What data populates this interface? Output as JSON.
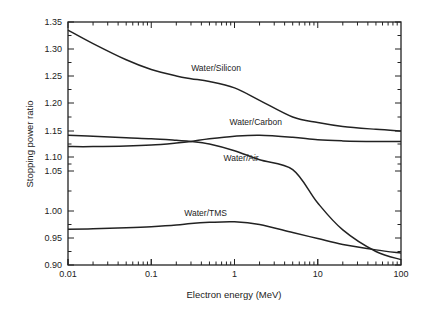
{
  "chart_data": {
    "type": "line",
    "title": "",
    "xlabel": "Electron energy (MeV)",
    "ylabel": "Stopping power ratio",
    "xscale": "log",
    "xlim": [
      0.01,
      100
    ],
    "ylim": [
      0.9,
      1.35
    ],
    "grid": false,
    "legend": "inline labels",
    "x_ticks": [
      "0.01",
      "0.1",
      "1",
      "10",
      "100"
    ],
    "y_ticks": [
      "0.90",
      "0.95",
      "1.00",
      "1.05",
      "1.10",
      "1.15",
      "1.20",
      "1.25",
      "1.30",
      "1.35"
    ],
    "x": [
      0.01,
      0.02,
      0.05,
      0.1,
      0.2,
      0.3,
      0.5,
      1,
      2,
      5,
      10,
      20,
      50,
      100
    ],
    "series": [
      {
        "name": "Water/Silicon",
        "values": [
          1.335,
          1.31,
          1.28,
          1.262,
          1.25,
          1.245,
          1.24,
          1.228,
          1.205,
          1.175,
          1.165,
          1.158,
          1.153,
          1.15
        ]
      },
      {
        "name": "Water/Carbon",
        "values": [
          1.12,
          1.12,
          1.121,
          1.123,
          1.127,
          1.13,
          1.135,
          1.14,
          1.142,
          1.138,
          1.133,
          1.131,
          1.13,
          1.13
        ]
      },
      {
        "name": "Water/Air",
        "values": [
          1.142,
          1.14,
          1.137,
          1.135,
          1.132,
          1.13,
          1.125,
          1.112,
          1.09,
          1.055,
          1.01,
          0.965,
          0.925,
          0.91
        ]
      },
      {
        "name": "Water/TMS",
        "values": [
          0.966,
          0.967,
          0.969,
          0.971,
          0.974,
          0.977,
          0.979,
          0.98,
          0.975,
          0.96,
          0.949,
          0.938,
          0.928,
          0.922
        ]
      }
    ],
    "annotations": [
      {
        "text": "Water/Silicon",
        "x": 0.6,
        "y": 1.26
      },
      {
        "text": "Water/Carbon",
        "x": 1.8,
        "y": 1.16
      },
      {
        "text": "Water/Air",
        "x": 1.2,
        "y": 1.085
      },
      {
        "text": "Water/TMS",
        "x": 0.45,
        "y": 0.99
      }
    ]
  }
}
